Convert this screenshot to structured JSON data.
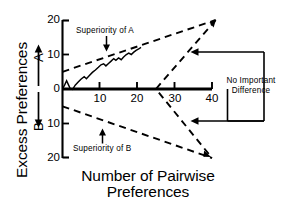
{
  "chart_data": {
    "type": "line",
    "title": "",
    "xlabel": "Number of Pairwise Preferences",
    "ylabel": "Excess Preferences",
    "xlim": [
      0,
      43
    ],
    "ylim": [
      -22,
      22
    ],
    "grid": false,
    "legend": "none",
    "xticks": [
      10,
      20,
      30,
      40
    ],
    "xticklabels": [
      "10",
      "20",
      "30",
      "40"
    ],
    "yticks": [
      20,
      10,
      0,
      -10,
      -20
    ],
    "yticklabels": [
      "20",
      "10",
      "0",
      "10",
      "20"
    ],
    "direction_labels": {
      "positive": "A",
      "negative": "B"
    },
    "annotations": [
      {
        "text": "Superiority of A",
        "x": 11,
        "y": 17.5,
        "arrow": "down"
      },
      {
        "text": "Superiority of B",
        "x": 11,
        "y": -17.0,
        "arrow": "up"
      },
      {
        "text": "No Important Difference",
        "x": 36,
        "y": 0,
        "arrow": "left-bracket"
      }
    ],
    "series": [
      {
        "name": "Upper decision boundary (superiority of A)",
        "style": "dashed",
        "points": [
          [
            0,
            5
          ],
          [
            41,
            20
          ]
        ]
      },
      {
        "name": "Lower decision boundary (superiority of B)",
        "style": "dashed",
        "points": [
          [
            0,
            -5
          ],
          [
            40,
            -20
          ]
        ]
      },
      {
        "name": "No important difference boundary",
        "style": "dashed",
        "points": [
          [
            41,
            20
          ],
          [
            25,
            0
          ],
          [
            40,
            -20
          ]
        ]
      },
      {
        "name": "Observed cumulative excess preferences",
        "style": "solid",
        "points": [
          [
            0,
            0
          ],
          [
            0.6,
            1.2
          ],
          [
            1.1,
            2.4
          ],
          [
            1.6,
            1.2
          ],
          [
            2.1,
            0.1
          ],
          [
            2.7,
            -0.1
          ],
          [
            3.4,
            1.1
          ],
          [
            4.2,
            2.0
          ],
          [
            5.0,
            2.9
          ],
          [
            5.8,
            3.6
          ],
          [
            6.4,
            3.0
          ],
          [
            7.2,
            3.9
          ],
          [
            8.0,
            4.8
          ],
          [
            8.8,
            5.5
          ],
          [
            9.6,
            6.3
          ],
          [
            10.3,
            7.0
          ],
          [
            11.0,
            7.3
          ],
          [
            11.6,
            6.7
          ],
          [
            12.3,
            7.4
          ],
          [
            13.0,
            8.1
          ],
          [
            13.7,
            8.8
          ],
          [
            14.3,
            8.3
          ],
          [
            15.0,
            9.0
          ],
          [
            15.7,
            8.5
          ],
          [
            16.3,
            9.2
          ],
          [
            17.0,
            9.9
          ],
          [
            17.7,
            10.4
          ],
          [
            18.4,
            10.0
          ],
          [
            19.0,
            10.6
          ],
          [
            19.7,
            11.2
          ],
          [
            20.4,
            11.6
          ],
          [
            21.0,
            12.1
          ]
        ]
      }
    ]
  },
  "axis_labels": {
    "y_main": "Excess Preferences",
    "x_main_line1": "Number of Pairwise",
    "x_main_line2": "Preferences",
    "letter_a": "A",
    "letter_b": "B"
  },
  "ticks": {
    "y_top": "20",
    "y_upper_mid": "10",
    "y_zero": "0",
    "y_lower_mid": "10",
    "y_bottom": "20",
    "x_10": "10",
    "x_20": "20",
    "x_30": "30",
    "x_40": "40"
  },
  "annotations": {
    "superiority_a": "Superiority of A",
    "superiority_b": "Superiority of B",
    "no_diff_line1": "No Important",
    "no_diff_line2": "Difference"
  },
  "colors": {
    "ink": "#000000",
    "background": "#ffffff"
  }
}
